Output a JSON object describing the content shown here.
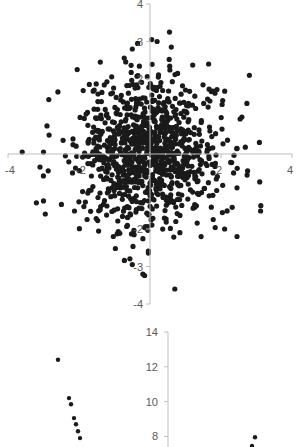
{
  "chart_data": [
    {
      "type": "scatter",
      "title": "",
      "xlabel": "",
      "ylabel": "",
      "xlim": [
        -4,
        4
      ],
      "ylim": [
        -4,
        4
      ],
      "grid": false,
      "legend": null,
      "axes_cross_at_origin": true,
      "x_ticks": [
        -4,
        -2,
        2,
        4
      ],
      "y_ticks": [
        4,
        3,
        2,
        -2,
        -3,
        -4
      ],
      "x_tick_labels": [
        "-4",
        "-2",
        "2",
        "4"
      ],
      "y_tick_labels": [
        "4",
        "3",
        "2",
        "-2",
        "-3",
        "-4"
      ],
      "marker_color": "#1a1a1a",
      "distribution": "bivariate standard normal, approx 1000 points centered at (0,0)",
      "generated": {
        "n": 1000,
        "mean": [
          0,
          0
        ],
        "sd": [
          1,
          1
        ],
        "seed": 7
      },
      "notable_points": [
        {
          "x": 0.55,
          "y": 3.25
        },
        {
          "x": 0.6,
          "y": 2.85
        },
        {
          "x": 0.2,
          "y": 3.0
        },
        {
          "x": -0.35,
          "y": 2.95
        },
        {
          "x": -0.5,
          "y": 2.8
        },
        {
          "x": 2.8,
          "y": 2.1
        },
        {
          "x": 1.65,
          "y": 2.4
        },
        {
          "x": -2.05,
          "y": 2.25
        },
        {
          "x": -1.4,
          "y": 2.45
        },
        {
          "x": -2.85,
          "y": 1.45
        },
        {
          "x": -2.9,
          "y": 0.75
        },
        {
          "x": -3.6,
          "y": 0.05
        },
        {
          "x": -3.0,
          "y": 0.05
        },
        {
          "x": -3.1,
          "y": -0.35
        },
        {
          "x": -3.2,
          "y": -1.3
        },
        {
          "x": -3.0,
          "y": -1.25
        },
        {
          "x": -2.95,
          "y": -1.6
        },
        {
          "x": 2.45,
          "y": 0.15
        },
        {
          "x": 2.75,
          "y": -0.45
        },
        {
          "x": 2.45,
          "y": -0.9
        },
        {
          "x": 2.1,
          "y": -2.0
        },
        {
          "x": 2.45,
          "y": -2.2
        },
        {
          "x": 0.7,
          "y": -3.6
        },
        {
          "x": -0.2,
          "y": -3.2
        },
        {
          "x": -0.5,
          "y": -2.95
        }
      ]
    },
    {
      "type": "scatter",
      "title": "",
      "xlabel": "",
      "ylabel": "",
      "ylim_visible": [
        8,
        14
      ],
      "y_ticks": [
        14,
        12,
        10,
        8
      ],
      "y_tick_labels": [
        "14",
        "12",
        "10",
        "8"
      ],
      "grid": false,
      "legend": null,
      "marker_color": "#1a1a1a",
      "note": "Chart cropped at bottom; only upper portion visible",
      "visible_points_pixel_estimate": [
        {
          "x_px": 58,
          "y": 12.4
        },
        {
          "x_px": 69,
          "y": 10.2
        },
        {
          "x_px": 71,
          "y": 9.85
        },
        {
          "x_px": 74,
          "y": 9.05
        },
        {
          "x_px": 76,
          "y": 8.7
        },
        {
          "x_px": 78,
          "y": 8.3
        },
        {
          "x_px": 80,
          "y": 7.9
        },
        {
          "x_px": 255,
          "y": 7.95
        },
        {
          "x_px": 252,
          "y": 7.45
        }
      ]
    }
  ]
}
